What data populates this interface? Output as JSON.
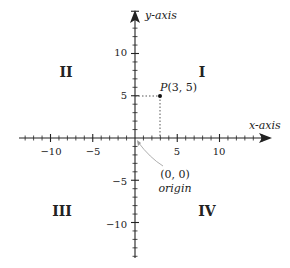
{
  "diagram": {
    "axes": {
      "x_label": "x-axis",
      "y_label": "y-axis",
      "x_tick_labels": [
        "−10",
        "−5",
        "5",
        "10"
      ],
      "y_tick_labels": [
        "10",
        "5",
        "−5",
        "−10"
      ],
      "x_range": [
        -13,
        15
      ],
      "y_range": [
        -14,
        15
      ],
      "minor_tick_step": 1,
      "major_tick_step": 5
    },
    "quadrants": {
      "I": "I",
      "II": "II",
      "III": "III",
      "IV": "IV"
    },
    "point": {
      "name": "P",
      "label": "P(3, 5)",
      "x": 3,
      "y": 5
    },
    "origin": {
      "coords": "(0, 0)",
      "label": "origin"
    }
  }
}
